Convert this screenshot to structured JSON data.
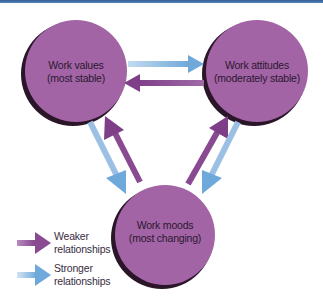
{
  "diagram": {
    "type": "cycle-relationship",
    "colors": {
      "top_bar": "#3E6EA5",
      "node_fill": "#A364A6",
      "node_shadow": "#2a1628",
      "weaker_arrow": "#8A4A92",
      "stronger_arrow": "#6FA8DA",
      "stronger_arrow_tail": "#B9D3EC"
    },
    "nodes": [
      {
        "id": "values",
        "line1": "Work values",
        "line2": "(most stable)"
      },
      {
        "id": "attitudes",
        "line1": "Work attitudes",
        "line2": "(moderately stable)"
      },
      {
        "id": "moods",
        "line1": "Work moods",
        "line2": "(most changing)"
      }
    ],
    "edges": [
      {
        "from": "values",
        "to": "attitudes",
        "strength": "stronger"
      },
      {
        "from": "attitudes",
        "to": "values",
        "strength": "weaker"
      },
      {
        "from": "values",
        "to": "moods",
        "strength": "stronger"
      },
      {
        "from": "moods",
        "to": "values",
        "strength": "weaker"
      },
      {
        "from": "attitudes",
        "to": "moods",
        "strength": "stronger"
      },
      {
        "from": "moods",
        "to": "attitudes",
        "strength": "weaker"
      }
    ],
    "legend": [
      {
        "key": "weaker",
        "line1": "Weaker",
        "line2": "relationships"
      },
      {
        "key": "stronger",
        "line1": "Stronger",
        "line2": "relationships"
      }
    ]
  }
}
